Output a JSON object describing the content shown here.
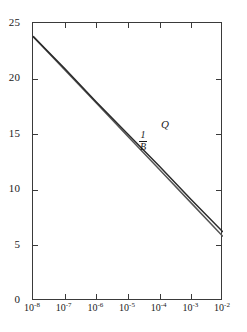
{
  "chart_data": {
    "type": "line",
    "title": "",
    "xlabel": "",
    "ylabel": "",
    "xscale": "log",
    "yscale": "linear",
    "xlim": [
      1e-08,
      0.01
    ],
    "ylim": [
      0,
      25
    ],
    "grid": false,
    "legend_position": "inline-annotation",
    "x_tick_labels": [
      "10−8",
      "10−7",
      "10−6",
      "10−5",
      "10−4",
      "10−3",
      "10−2"
    ],
    "x_tick_mantissa": "10",
    "x_tick_exponents": [
      "-8",
      "-7",
      "-6",
      "-5",
      "-4",
      "-3",
      "-2"
    ],
    "x_ticks": [
      1e-08,
      1e-07,
      1e-06,
      1e-05,
      0.0001,
      0.001,
      0.01
    ],
    "y_tick_labels": [
      "0",
      "5",
      "10",
      "15",
      "20",
      "25"
    ],
    "y_ticks": [
      0,
      5,
      10,
      15,
      20,
      25
    ],
    "x": [
      1e-08,
      1e-07,
      1e-06,
      1e-05,
      0.0001,
      0.001,
      0.01
    ],
    "series": [
      {
        "name": "Q",
        "label": "Q",
        "color": "#2b2b2b",
        "values": [
          23.8,
          20.9,
          17.9,
          15.0,
          12.1,
          9.1,
          6.2
        ]
      },
      {
        "name": "1/B",
        "label": "1/B",
        "label_numerator": "1",
        "label_denominator": "B",
        "color": "#555555",
        "values": [
          23.8,
          20.8,
          17.8,
          14.8,
          11.8,
          8.8,
          5.8
        ]
      }
    ],
    "annotations": [
      {
        "text": "Q",
        "x": 1e-05,
        "y": 15.6
      },
      {
        "text": "1/B",
        "x": 2.2e-06,
        "y": 13.9
      }
    ]
  },
  "axes": {
    "frame_color": "#3a3a3a",
    "background": "#ffffff"
  }
}
